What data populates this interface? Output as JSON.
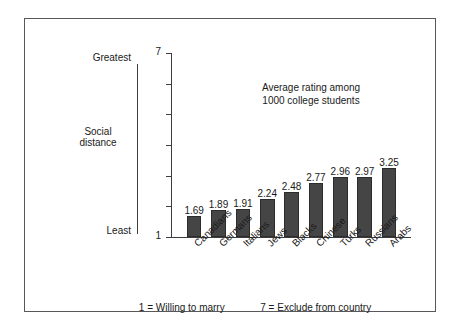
{
  "chart_data": {
    "type": "bar",
    "title": "",
    "annotation": [
      "Average rating among",
      "1000 college students"
    ],
    "categories": [
      "Canadians",
      "Germans",
      "Italians",
      "Jews",
      "Blacks",
      "Chinese",
      "Turks",
      "Russians",
      "Arabs"
    ],
    "values": [
      1.69,
      1.89,
      1.91,
      2.24,
      2.48,
      2.77,
      2.96,
      2.97,
      3.25
    ],
    "value_labels": [
      "1.69",
      "1.89",
      "1.91",
      "2.24",
      "2.48",
      "2.77",
      "2.96",
      "2.97",
      "3.25"
    ],
    "xlabel": "",
    "ylabel": "Social distance",
    "ylim": [
      1,
      7
    ],
    "yticks": [
      1,
      2,
      3,
      4,
      5,
      6,
      7
    ],
    "ytick_labels": [
      "1",
      "",
      "",
      "",
      "",
      "",
      "7"
    ],
    "grid": false,
    "legend": "none",
    "bar_color": "#454546",
    "axis_color": "#3d3d3f",
    "frame_color": "#58585a"
  },
  "descriptor_axis": {
    "top_label": "Greatest",
    "middle_label_line1": "Social",
    "middle_label_line2": "distance",
    "bottom_label": "Least"
  },
  "footnote": {
    "left": "1  =  Willing to marry",
    "right": "7  =  Exclude from country"
  }
}
